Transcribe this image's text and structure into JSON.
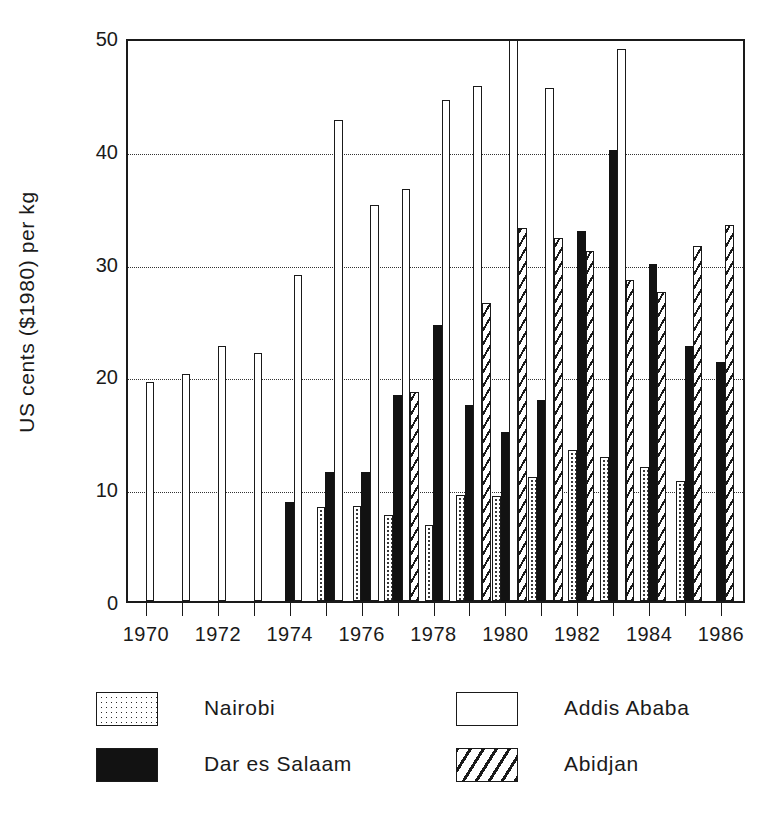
{
  "chart_data": {
    "type": "bar",
    "title": "",
    "xlabel": "",
    "ylabel": "US cents ($1980) per kg",
    "ylim": [
      0,
      50
    ],
    "yticks": [
      0,
      10,
      20,
      30,
      40,
      50
    ],
    "grid": "horizontal-dotted",
    "legend_position": "below",
    "x": [
      1970,
      1971,
      1972,
      1973,
      1974,
      1975,
      1976,
      1977,
      1978,
      1979,
      1980,
      1981,
      1982,
      1983,
      1984,
      1985,
      1986
    ],
    "xtick_labels": [
      "1970",
      "",
      "1972",
      "",
      "1974",
      "",
      "1976",
      "",
      "1978",
      "",
      "1980",
      "",
      "1982",
      "",
      "1984",
      "",
      "1986"
    ],
    "categories": [
      "1970",
      "1971",
      "1972",
      "1973",
      "1974",
      "1975",
      "1976",
      "1977",
      "1978",
      "1979",
      "1980",
      "1981",
      "1982",
      "1983",
      "1984",
      "1985",
      "1986"
    ],
    "series": [
      {
        "name": "Nairobi",
        "fill": "dotted",
        "color": "#ffffff",
        "values": [
          null,
          null,
          null,
          null,
          null,
          8.3,
          8.4,
          7.6,
          6.7,
          9.4,
          9.3,
          11.0,
          13.4,
          12.8,
          11.9,
          10.6,
          null
        ]
      },
      {
        "name": "Dar es Salaam",
        "fill": "solid-black",
        "color": "#121212",
        "values": [
          null,
          null,
          null,
          null,
          8.8,
          11.4,
          11.4,
          18.3,
          24.5,
          17.4,
          15.0,
          17.8,
          32.8,
          40.0,
          29.9,
          22.6,
          21.2
        ]
      },
      {
        "name": "Addis Ababa",
        "fill": "empty",
        "color": "#ffffff",
        "values": [
          19.4,
          20.1,
          22.6,
          22.0,
          28.9,
          42.6,
          35.1,
          36.5,
          44.4,
          45.7,
          50.0,
          45.5,
          null,
          48.9,
          null,
          null,
          null
        ]
      },
      {
        "name": "Abidjan",
        "fill": "diagonal-hatch",
        "color": "#ffffff",
        "values": [
          null,
          null,
          null,
          null,
          null,
          null,
          null,
          18.5,
          null,
          26.4,
          33.1,
          32.2,
          31.0,
          28.5,
          27.4,
          31.5,
          33.3
        ]
      }
    ]
  },
  "axes": {
    "y_title": "US cents ($1980) per kg",
    "y_tick_labels": [
      "50",
      "40",
      "30",
      "20",
      "10",
      "0"
    ],
    "x_tick_labels": [
      "1970",
      "1972",
      "1974",
      "1976",
      "1978",
      "1980",
      "1982",
      "1984",
      "1986"
    ]
  },
  "legend": {
    "entries": [
      {
        "label": "Nairobi",
        "swatch": "nairobi"
      },
      {
        "label": "Addis Ababa",
        "swatch": "addis"
      },
      {
        "label": "Dar es Salaam",
        "swatch": "dar"
      },
      {
        "label": "Abidjan",
        "swatch": "abidjan"
      }
    ]
  }
}
